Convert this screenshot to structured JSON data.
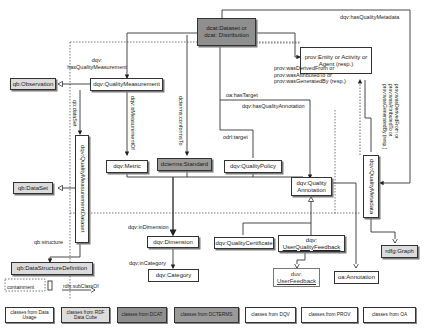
{
  "diagram": {
    "colors": {
      "dqv_fill": "#ffffff",
      "qb_fill": "#dcdcdc",
      "dcat_fill": "#8f8f8f",
      "dcterms_fill": "#9a9a9a",
      "line": "#333333",
      "containment_dotted": "#555555"
    },
    "nodes": {
      "dcat_dataset": "dcat:Dataset or dcat: Distribution",
      "prov_entity": "prov:Entity or Activity or Agent (resp.)",
      "qb_observation": "qb:Observation",
      "quality_measurement": "dqv:QualityMeasurement",
      "quality_measurement_dataset": "dqv:QualityMeasurementDataset",
      "qb_dataset": "qb:DataSet",
      "metric": "dqv:Metric",
      "standard": "dcterms:Standard",
      "quality_policy": "dqv:QualityPolicy",
      "quality_annotation_1": "dqv:Quality",
      "quality_annotation_2": "Annotation",
      "quality_metadata": "dqv:QualityMetadata",
      "dimension": "dqv:Dimension",
      "category": "dqv:Category",
      "quality_certificate": "dqv:QualityCertificate",
      "user_quality_feedback_1": "dqv:",
      "user_quality_feedback_2": "UserQualityFeedback",
      "duv_user_feedback_1": "duv:",
      "duv_user_feedback_2": "UserFeedback",
      "oa_annotation": "oa:Annotation",
      "rdfg_graph": "rdfg:Graph",
      "data_structure_definition": "qb:DataStructureDefinition"
    },
    "edges": {
      "has_quality_metadata": "dqv:hasQualityMetadata",
      "has_quality_measurement_1": "dqv:",
      "has_quality_measurement_2": "hasQualityMeasurement",
      "prov_rel_1": "prov:wasDerivedFrom or",
      "prov_rel_2": "prov:wasAttributedTo or",
      "prov_rel_3": "prov:wasGeneratedBy (resp.)",
      "prov_rel_vert": "prov:wasDerivedFrom or prov:wasAttributedTo or prov:wasGeneratedBy (resp.)",
      "qb_dataset_rel": "qb:dataSet",
      "is_measurement_of": "dqv:isMeasurementOf",
      "conforms_to": "dcterms:conformsTo",
      "has_target": "oa:hasTarget",
      "has_quality_annotation": "dqv:hasQualityAnnotation",
      "odrl_target": "odrl:target",
      "in_dimension": "dqv:inDimension",
      "in_category": "dqv:inCategory",
      "qb_structure": "qb:structure"
    },
    "key": {
      "containment": "containment",
      "subclass": "rdfs:subClassOf"
    },
    "legend": [
      "classes from Data Usage",
      "classes from RDF Data Cube",
      "classes from DCAT",
      "classes from DCTERMS",
      "classes from DQV",
      "classes from PROV",
      "classes from OA"
    ]
  }
}
